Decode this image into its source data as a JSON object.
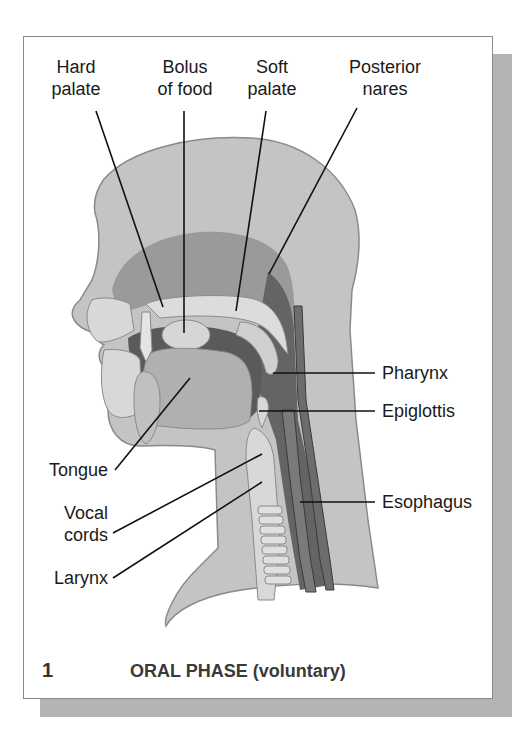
{
  "figure": {
    "number": "1",
    "caption": "ORAL PHASE (voluntary)"
  },
  "labels": {
    "hard_palate": "Hard\npalate",
    "bolus": "Bolus\nof food",
    "soft_palate": "Soft\npalate",
    "posterior_nares": "Posterior\nnares",
    "pharynx": "Pharynx",
    "epiglottis": "Epiglottis",
    "esophagus": "Esophagus",
    "tongue": "Tongue",
    "vocal_cords": "Vocal\ncords",
    "larynx": "Larynx"
  },
  "colors": {
    "skin": "#c4c4c4",
    "nasal": "#8e8e8e",
    "dark_cavity": "#5a5a5a",
    "pale": "#dcdcdc",
    "outline": "#7a7a7a",
    "leader": "#111111",
    "shadow": "#b4b4b4"
  }
}
